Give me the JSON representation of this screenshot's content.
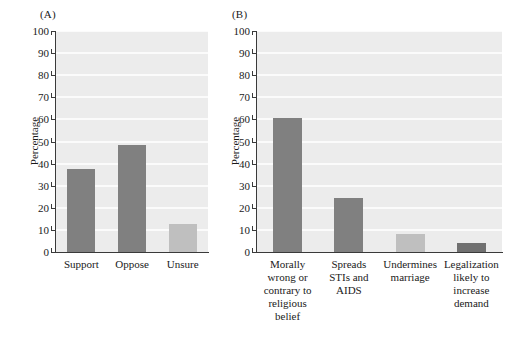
{
  "figure": {
    "background": "#ffffff",
    "panel_bg": "#ececec",
    "gridline_color": "#fbfbfb",
    "axis_color": "#3a3a3a",
    "color_dark": "#808080",
    "color_light": "#bfbfbf"
  },
  "panels": [
    {
      "label": "(A)",
      "ylabel": "Percentage"
    },
    {
      "label": "(B)",
      "ylabel": "Percentage"
    }
  ],
  "yticks": [
    "100",
    "90",
    "80",
    "70",
    "60",
    "50",
    "40",
    "30",
    "20",
    "10",
    "0"
  ],
  "chart_data": [
    {
      "type": "bar",
      "panel": "(A)",
      "title": "",
      "xlabel": "",
      "ylabel": "Percentage",
      "ylim": [
        0,
        100
      ],
      "yticks": [
        0,
        10,
        20,
        30,
        40,
        50,
        60,
        70,
        80,
        90,
        100
      ],
      "grid": true,
      "legend": "none",
      "categories": [
        "Support",
        "Oppose",
        "Unsure"
      ],
      "values": [
        37.5,
        48.5,
        12.5
      ],
      "bar_colors": [
        "#808080",
        "#808080",
        "#bfbfbf"
      ]
    },
    {
      "type": "bar",
      "panel": "(B)",
      "title": "",
      "xlabel": "",
      "ylabel": "Percentage",
      "ylim": [
        0,
        100
      ],
      "yticks": [
        0,
        10,
        20,
        30,
        40,
        50,
        60,
        70,
        80,
        90,
        100
      ],
      "grid": true,
      "legend": "none",
      "categories": [
        "Morally\nwrong or\ncontrary to\nreligious\nbelief",
        "Spreads\nSTIs and\nAIDS",
        "Undermines\nmarriage",
        "Legalization\nlikely to\nincrease\ndemand"
      ],
      "values": [
        60.8,
        24.6,
        8.2,
        4.1
      ],
      "bar_colors": [
        "#808080",
        "#808080",
        "#bfbfbf",
        "#707070"
      ]
    }
  ]
}
